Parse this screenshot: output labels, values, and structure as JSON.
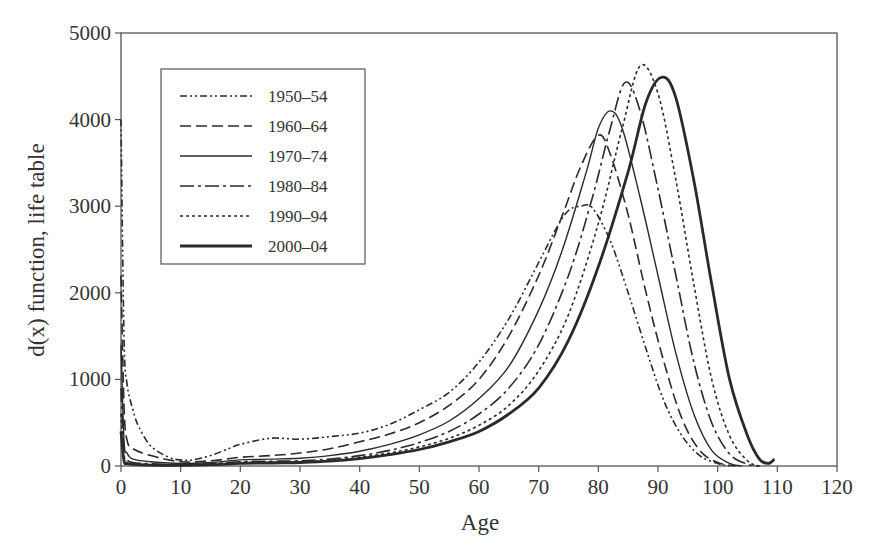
{
  "chart_data": {
    "type": "line",
    "title": "",
    "xlabel": "Age",
    "ylabel": "d(x) function, life table",
    "xlim": [
      0,
      120
    ],
    "ylim": [
      0,
      5000
    ],
    "xticks": [
      0,
      10,
      20,
      30,
      40,
      50,
      60,
      70,
      80,
      90,
      100,
      110,
      120
    ],
    "yticks": [
      0,
      1000,
      2000,
      3000,
      4000,
      5000
    ],
    "grid": false,
    "legend_position": "upper-left",
    "series": [
      {
        "name": "1950–54",
        "style": "dash-dot-dot",
        "width": 1.6,
        "x": [
          0,
          0.5,
          1,
          2,
          3,
          5,
          8,
          10,
          12,
          15,
          18,
          20,
          25,
          30,
          35,
          40,
          45,
          50,
          55,
          60,
          65,
          70,
          73,
          75,
          77,
          79,
          82,
          85,
          88,
          91,
          94,
          97,
          100,
          102
        ],
        "y": [
          4000,
          1500,
          950,
          650,
          450,
          230,
          100,
          70,
          70,
          120,
          200,
          250,
          320,
          310,
          340,
          380,
          480,
          650,
          850,
          1200,
          1700,
          2350,
          2750,
          2950,
          3000,
          2980,
          2600,
          2000,
          1350,
          750,
          350,
          120,
          30,
          0
        ]
      },
      {
        "name": "1960–64",
        "style": "dashed",
        "width": 1.6,
        "x": [
          0,
          0.5,
          1,
          2,
          5,
          10,
          15,
          20,
          25,
          30,
          35,
          40,
          45,
          50,
          55,
          60,
          65,
          70,
          74,
          77,
          80,
          82,
          85,
          88,
          91,
          94,
          97,
          100,
          103
        ],
        "y": [
          2200,
          700,
          300,
          200,
          120,
          50,
          60,
          100,
          120,
          150,
          200,
          280,
          370,
          500,
          700,
          1000,
          1500,
          2200,
          2900,
          3450,
          3820,
          3600,
          2900,
          2000,
          1200,
          550,
          180,
          40,
          0
        ]
      },
      {
        "name": "1970–74",
        "style": "solid",
        "width": 1.4,
        "x": [
          0,
          0.5,
          1,
          2,
          5,
          10,
          15,
          20,
          25,
          30,
          35,
          40,
          45,
          50,
          55,
          60,
          65,
          70,
          74,
          78,
          80,
          82,
          84,
          87,
          90,
          93,
          96,
          99,
          102,
          104
        ],
        "y": [
          1400,
          300,
          150,
          80,
          50,
          30,
          40,
          70,
          80,
          90,
          120,
          170,
          250,
          360,
          520,
          780,
          1150,
          1800,
          2500,
          3400,
          3900,
          4100,
          3900,
          3100,
          2200,
          1300,
          600,
          180,
          30,
          0
        ]
      },
      {
        "name": "1980–84",
        "style": "dash-dot",
        "width": 1.6,
        "x": [
          0,
          0.5,
          1,
          2,
          5,
          10,
          15,
          20,
          25,
          30,
          35,
          40,
          45,
          50,
          55,
          60,
          65,
          70,
          75,
          79,
          82,
          84.5,
          87,
          90,
          93,
          96,
          99,
          102,
          105,
          107
        ],
        "y": [
          900,
          150,
          70,
          40,
          25,
          15,
          25,
          50,
          55,
          60,
          80,
          120,
          180,
          270,
          400,
          600,
          900,
          1400,
          2200,
          3100,
          3900,
          4430,
          4100,
          3200,
          2200,
          1200,
          500,
          140,
          20,
          0
        ]
      },
      {
        "name": "1990–94",
        "style": "dotted",
        "width": 1.6,
        "x": [
          0,
          0.5,
          1,
          2,
          5,
          10,
          15,
          20,
          25,
          30,
          35,
          40,
          45,
          50,
          55,
          60,
          65,
          70,
          75,
          80,
          84,
          87,
          90,
          93,
          96,
          99,
          102,
          105,
          107
        ],
        "y": [
          600,
          90,
          40,
          25,
          15,
          10,
          20,
          40,
          45,
          50,
          65,
          100,
          150,
          220,
          320,
          470,
          700,
          1100,
          1750,
          2800,
          3900,
          4620,
          4300,
          3300,
          2100,
          1000,
          350,
          60,
          0
        ]
      },
      {
        "name": "2000–04",
        "style": "solid-thick",
        "width": 2.8,
        "x": [
          0,
          0.5,
          1,
          2,
          5,
          10,
          15,
          20,
          25,
          30,
          35,
          40,
          45,
          50,
          55,
          60,
          65,
          70,
          75,
          80,
          85,
          88,
          90.7,
          93,
          96,
          99,
          102,
          105,
          107,
          108.5,
          109.5
        ],
        "y": [
          400,
          60,
          30,
          20,
          10,
          8,
          15,
          30,
          35,
          40,
          55,
          85,
          130,
          190,
          280,
          400,
          600,
          900,
          1450,
          2300,
          3400,
          4200,
          4490,
          4250,
          3300,
          2100,
          1000,
          350,
          80,
          30,
          80
        ]
      }
    ]
  },
  "legend": {
    "items": [
      {
        "label": "1950–54"
      },
      {
        "label": "1960–64"
      },
      {
        "label": "1970–74"
      },
      {
        "label": "1980–84"
      },
      {
        "label": "1990–94"
      },
      {
        "label": "2000–04"
      }
    ]
  },
  "axes": {
    "x_title": "Age",
    "y_title": "d(x) function, life table"
  },
  "colors": {
    "line": "#2a2a2a",
    "axis": "#555555",
    "text": "#333333"
  }
}
